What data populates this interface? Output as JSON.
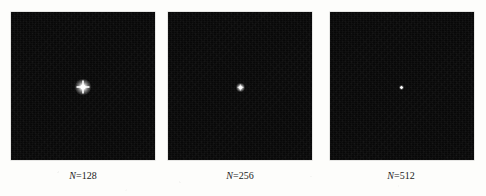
{
  "figure": {
    "type": "image-panel-series",
    "background_color": "#fdfdfb",
    "panel_color": "#080808",
    "spot_color": "#ffffff",
    "caption_color": "#1a1a1a",
    "panels": [
      {
        "id": "panel-n128",
        "caption_symbol": "N",
        "caption_equals": "=",
        "caption_value": "128",
        "caption_full": "N=128",
        "x": 11,
        "y": 12,
        "width": 144,
        "height": 148,
        "spot": {
          "cx": 83,
          "cy": 87,
          "core_size": 5,
          "halo_size": 16,
          "spike_len": 13,
          "spike_thick": 2
        },
        "caption_center_x": 83,
        "caption_y": 170
      },
      {
        "id": "panel-n256",
        "caption_symbol": "N",
        "caption_equals": "=",
        "caption_value": "256",
        "caption_full": "N=256",
        "x": 168,
        "y": 12,
        "width": 144,
        "height": 148,
        "spot": {
          "cx": 240,
          "cy": 87,
          "core_size": 3,
          "halo_size": 9,
          "spike_len": 6,
          "spike_thick": 1.4
        },
        "caption_center_x": 240,
        "caption_y": 170
      },
      {
        "id": "panel-n512",
        "caption_symbol": "N",
        "caption_equals": "=",
        "caption_value": "512",
        "caption_full": "N=512",
        "x": 330,
        "y": 12,
        "width": 144,
        "height": 148,
        "spot": {
          "cx": 401,
          "cy": 87,
          "core_size": 2,
          "halo_size": 5,
          "spike_len": 3,
          "spike_thick": 1
        },
        "caption_center_x": 401,
        "caption_y": 170
      }
    ]
  }
}
